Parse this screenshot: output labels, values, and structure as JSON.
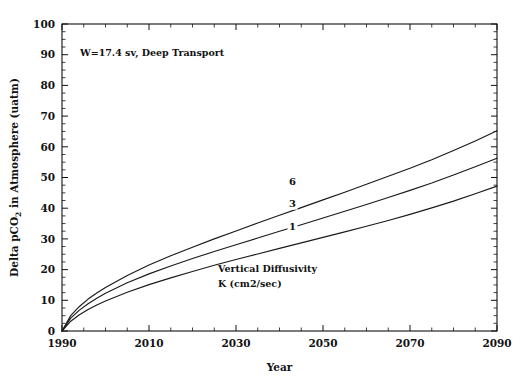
{
  "chart_data": {
    "type": "line",
    "title": "",
    "annotation_top": "W=17.4 sv, Deep Transport",
    "annotation_legend_line1": "Vertical Diffusivity",
    "annotation_legend_line2": "K (cm2/sec)",
    "xlabel": "Year",
    "ylabel_part1": "Delta pCO",
    "ylabel_sub": "2",
    "ylabel_part2": " in Atmosphere (uatm)",
    "ylabel_full": "Delta pCO2 in Atmosphere (uatm)",
    "xlim": [
      1990,
      2090
    ],
    "ylim": [
      0,
      100
    ],
    "xticks_major": [
      1990,
      2010,
      2030,
      2050,
      2070,
      2090
    ],
    "xtick_labels": [
      "1990",
      "2010",
      "2030",
      "2050",
      "2070",
      "2090"
    ],
    "xtick_minor_step": 5,
    "yticks_major": [
      0,
      10,
      20,
      30,
      40,
      50,
      60,
      70,
      80,
      90,
      100
    ],
    "ytick_labels": [
      "0",
      "10",
      "20",
      "30",
      "40",
      "50",
      "60",
      "70",
      "80",
      "90",
      "100"
    ],
    "ytick_minor_step": 2.5,
    "grid": false,
    "legend_position": "inline-curve-labels",
    "line_color": "#1a1a1a",
    "x": [
      1990,
      1992,
      1994,
      1996,
      1998,
      2000,
      2005,
      2010,
      2015,
      2020,
      2025,
      2030,
      2035,
      2040,
      2045,
      2050,
      2055,
      2060,
      2065,
      2070,
      2075,
      2080,
      2085,
      2090
    ],
    "series": [
      {
        "name": "6",
        "label": "6",
        "label_x": 2043,
        "label_y": 47.5,
        "values": [
          0,
          5.0,
          8.0,
          10.4,
          12.4,
          14.2,
          18.1,
          21.5,
          24.5,
          27.3,
          30.0,
          32.6,
          35.2,
          37.7,
          40.2,
          42.7,
          45.2,
          47.8,
          50.4,
          53.0,
          55.8,
          58.8,
          61.9,
          65.2
        ]
      },
      {
        "name": "3",
        "label": "3",
        "label_x": 2043,
        "label_y": 40.5,
        "values": [
          0,
          4.2,
          6.8,
          8.9,
          10.7,
          12.3,
          15.7,
          18.6,
          21.2,
          23.6,
          25.9,
          28.1,
          30.3,
          32.5,
          34.6,
          36.8,
          39.0,
          41.2,
          43.5,
          45.8,
          48.2,
          50.8,
          53.5,
          56.3
        ]
      },
      {
        "name": "1",
        "label": "1",
        "label_x": 2043,
        "label_y": 33.0,
        "values": [
          0,
          3.2,
          5.3,
          7.0,
          8.5,
          9.8,
          12.6,
          15.1,
          17.3,
          19.4,
          21.4,
          23.3,
          25.1,
          26.9,
          28.7,
          30.5,
          32.3,
          34.1,
          36.0,
          38.0,
          40.1,
          42.3,
          44.7,
          47.2
        ]
      }
    ]
  }
}
